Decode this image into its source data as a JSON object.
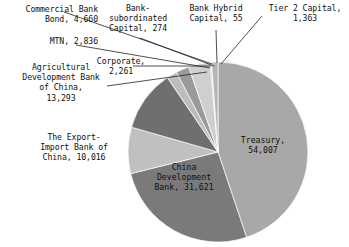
{
  "chart_data": {
    "type": "pie",
    "title": "",
    "subtitle": "",
    "xlabel": "",
    "ylabel": "",
    "legend_position": "none",
    "grid": false,
    "total": 120386,
    "units": "",
    "start_angle_deg": 0,
    "direction": "clockwise",
    "categories": [
      "Treasury",
      "China Development Bank",
      "The Export-Import Bank of China",
      "Agricultural Development Bank of China",
      "Corporate",
      "MTN",
      "Commercial Bank Bond",
      "Bank-subordinated Capital",
      "Bank Hybrid Capital",
      "Tier 2 Capital"
    ],
    "values": [
      54007,
      31621,
      10016,
      13293,
      2261,
      2836,
      4660,
      274,
      55,
      1363
    ],
    "colors": [
      "#a8a8a8",
      "#7a7a7a",
      "#c0c0c0",
      "#6f6f6f",
      "#bdbdbd",
      "#9a9a9a",
      "#cfcfcf",
      "#a0a0a0",
      "#8e8e8e",
      "#b5b5b5"
    ],
    "slices": [
      {
        "name": "Treasury",
        "value": 54007,
        "value_text": "54,007",
        "color": "#a8a8a8"
      },
      {
        "name": "China Development Bank",
        "value": 31621,
        "value_text": "31,621",
        "color": "#7a7a7a"
      },
      {
        "name": "The Export-Import Bank of China",
        "value": 10016,
        "value_text": "10,016",
        "color": "#c0c0c0"
      },
      {
        "name": "Agricultural Development Bank of China",
        "value": 13293,
        "value_text": "13,293",
        "color": "#6f6f6f"
      },
      {
        "name": "Corporate",
        "value": 2261,
        "value_text": "2,261",
        "color": "#bdbdbd"
      },
      {
        "name": "MTN",
        "value": 2836,
        "value_text": "2,836",
        "color": "#9a9a9a"
      },
      {
        "name": "Commercial Bank Bond",
        "value": 4660,
        "value_text": "4,660",
        "color": "#cfcfcf"
      },
      {
        "name": "Bank-subordinated Capital",
        "value": 274,
        "value_text": "274",
        "color": "#a0a0a0"
      },
      {
        "name": "Bank Hybrid Capital",
        "value": 55,
        "value_text": "55",
        "color": "#8e8e8e"
      },
      {
        "name": "Tier 2 Capital",
        "value": 1363,
        "value_text": "1,363",
        "color": "#b5b5b5"
      }
    ]
  },
  "labels": {
    "commercial_bank_bond": "Commercial Bank\nBond,   4,660",
    "mtn": "MTN,   2,836",
    "bank_subordinated_capital": "Bank-\nsubordinated\nCapital,   274",
    "bank_hybrid_capital": "Bank Hybrid\nCapital,   55",
    "tier2_capital": "Tier 2 Capital,\n1,363",
    "agricultural_development_bank": "Agricultural\nDevelopment Bank\nof China,\n13,293",
    "corporate": "Corporate,\n2,261",
    "export_import_bank": "The Export-\nImport Bank of\nChina,   10,016",
    "china_development_bank": "China\nDevelopment\nBank,   31,621",
    "treasury": "Treasury,\n54,007"
  }
}
